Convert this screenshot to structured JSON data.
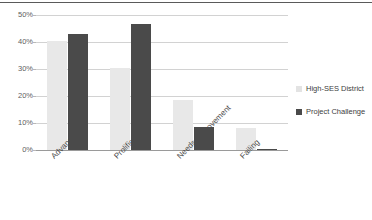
{
  "chart_data": {
    "type": "bar",
    "title": "",
    "subtitle": "",
    "xlabel": "",
    "ylabel": "",
    "ylim": [
      0,
      50
    ],
    "ytick_labels": [
      "50%",
      "40%",
      "30%",
      "20%",
      "10%",
      "0%"
    ],
    "ytick_values": [
      50,
      40,
      30,
      20,
      10,
      0
    ],
    "grid": true,
    "legend_position": "right",
    "categories": [
      "Advanced",
      "Prolific",
      "Needs Improvement",
      "Failing"
    ],
    "series": [
      {
        "name": "High-SES District",
        "color": "#e8e8e8",
        "values": [
          40.5,
          30.5,
          18.5,
          8.0
        ]
      },
      {
        "name": "Project Challenge",
        "color": "#4a4a4a",
        "values": [
          42.8,
          46.5,
          8.5,
          0.5
        ]
      }
    ]
  },
  "legend": {
    "items": [
      {
        "label": "High-SES District",
        "color": "#e8e8e8"
      },
      {
        "label": "Project Challenge",
        "color": "#4a4a4a"
      }
    ]
  },
  "axis": {
    "ticks": [
      {
        "label": "50%"
      },
      {
        "label": "40%"
      },
      {
        "label": "30%"
      },
      {
        "label": "20%"
      },
      {
        "label": "10%"
      },
      {
        "label": "0%"
      }
    ]
  },
  "categories": [
    {
      "label": "Advanced"
    },
    {
      "label": "Prolific"
    },
    {
      "label": "Needs Improvement"
    },
    {
      "label": "Failing"
    }
  ]
}
